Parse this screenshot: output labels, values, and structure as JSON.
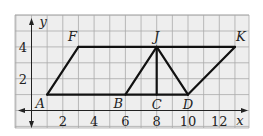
{
  "figure": {
    "x_axis_label": "x",
    "y_axis_label": "y",
    "x_range": [
      -1,
      14
    ],
    "y_range": [
      -1,
      6
    ],
    "x_ticks": [
      {
        "value": 2,
        "label": "2"
      },
      {
        "value": 4,
        "label": "4"
      },
      {
        "value": 6,
        "label": "6"
      },
      {
        "value": 8,
        "label": "8"
      },
      {
        "value": 10,
        "label": "10"
      },
      {
        "value": 12,
        "label": "12"
      }
    ],
    "y_ticks": [
      {
        "value": 2,
        "label": "2"
      },
      {
        "value": 4,
        "label": "4"
      }
    ],
    "points": [
      {
        "name": "A",
        "x": 1,
        "y": 1,
        "label_pos": "below-left"
      },
      {
        "name": "F",
        "x": 3,
        "y": 4,
        "label_pos": "above-left"
      },
      {
        "name": "J",
        "x": 8,
        "y": 4,
        "label_pos": "above"
      },
      {
        "name": "K",
        "x": 13,
        "y": 4,
        "label_pos": "above-right"
      },
      {
        "name": "B",
        "x": 6,
        "y": 1,
        "label_pos": "below-left"
      },
      {
        "name": "C",
        "x": 8,
        "y": 1,
        "label_pos": "below"
      },
      {
        "name": "D",
        "x": 10,
        "y": 1,
        "label_pos": "below"
      }
    ],
    "segments": [
      [
        "A",
        "F"
      ],
      [
        "F",
        "K"
      ],
      [
        "A",
        "D"
      ],
      [
        "B",
        "J"
      ],
      [
        "J",
        "C"
      ],
      [
        "J",
        "D"
      ],
      [
        "D",
        "K"
      ]
    ]
  }
}
